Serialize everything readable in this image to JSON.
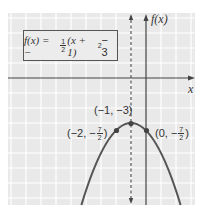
{
  "diagram": {
    "type": "function-graph",
    "function_label": {
      "prefix": "f(x) = −",
      "frac_num": "1",
      "frac_den": "2",
      "middle": "(x + 1)",
      "exponent": "2",
      "suffix": " − 3"
    },
    "axes": {
      "x_label": "x",
      "y_label": "f(x)"
    },
    "axis_of_symmetry": {
      "x": -1,
      "style": "dashed"
    },
    "points": [
      {
        "label_text": "(−1, −3)",
        "x": -1,
        "y": -3
      },
      {
        "label_prefix": "(−2, −",
        "frac_num": "7",
        "frac_den": "2",
        "label_suffix": ")",
        "x": -2,
        "y": -3.5
      },
      {
        "label_prefix": "(0, −",
        "frac_num": "7",
        "frac_den": "2",
        "label_suffix": ")",
        "x": 0,
        "y": -3.5
      }
    ],
    "colors": {
      "grid_bg": "#e9e9e9",
      "grid_line": "#ffffff",
      "axis": "#444444",
      "curve": "#555555",
      "point": "#444444"
    }
  }
}
